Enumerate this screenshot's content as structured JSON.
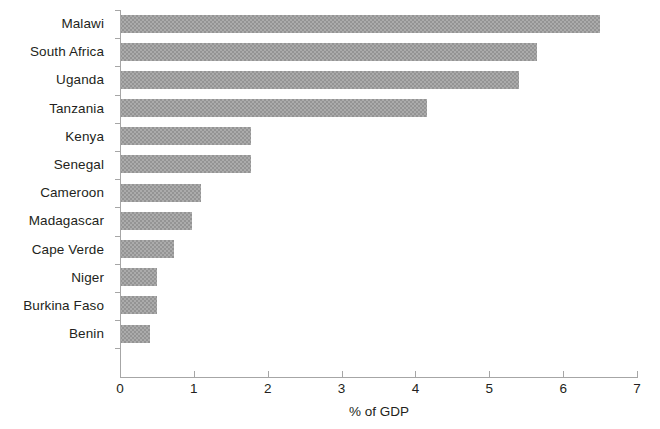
{
  "chart_data": {
    "type": "bar",
    "orientation": "horizontal",
    "title": "",
    "subtitle": "",
    "xlabel": "% of GDP",
    "ylabel": "",
    "xlim": [
      0,
      7
    ],
    "xticks": [
      "0",
      "1",
      "2",
      "3",
      "4",
      "5",
      "6",
      "7"
    ],
    "grid": false,
    "legend": null,
    "bar_color": "#949494",
    "axis_color": "#a6a6a6",
    "text_color": "#231f20",
    "categories": [
      "Malawi",
      "South Africa",
      "Uganda",
      "Tanzania",
      "Kenya",
      "Senegal",
      "Cameroon",
      "Madagascar",
      "Cape Verde",
      "Niger",
      "Burkina Faso",
      "Benin"
    ],
    "values": [
      6.5,
      5.65,
      5.4,
      4.15,
      1.78,
      1.78,
      1.1,
      0.97,
      0.73,
      0.5,
      0.5,
      0.4
    ]
  }
}
